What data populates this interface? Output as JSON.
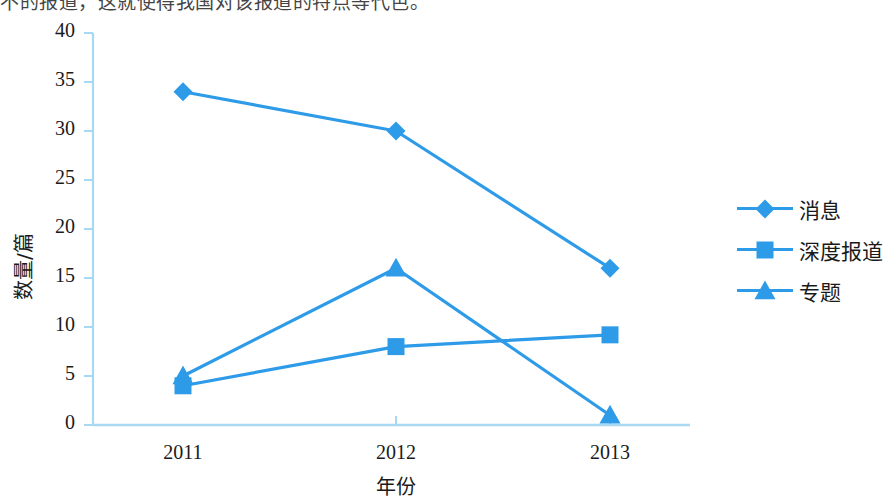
{
  "caption": "不的报道，这就使得我国对该报道的特点等代色。",
  "legend": {
    "position": "right",
    "items": [
      {
        "label": "消息",
        "marker": "diamond",
        "color": "#2E9BE8"
      },
      {
        "label": "深度报道",
        "marker": "square",
        "color": "#2E9BE8"
      },
      {
        "label": "专题",
        "marker": "triangle",
        "color": "#2E9BE8"
      }
    ]
  },
  "axes": {
    "y_title": "数量/篇",
    "x_title": "年份",
    "y_ticks": [
      "0",
      "5",
      "10",
      "15",
      "20",
      "25",
      "30",
      "35",
      "40"
    ],
    "x_ticks": [
      "2011",
      "2012",
      "2013"
    ]
  },
  "colors": {
    "series": "#2E9BE8",
    "axis": "#A9D8F2",
    "text": "#1a1a1a"
  },
  "chart_data": {
    "type": "line",
    "title": "",
    "xlabel": "年份",
    "ylabel": "数量/篇",
    "categories": [
      "2011",
      "2012",
      "2013"
    ],
    "ylim": [
      0,
      40
    ],
    "ytick_step": 5,
    "grid": false,
    "legend_position": "right",
    "series": [
      {
        "name": "消息",
        "marker": "diamond",
        "color": "#2E9BE8",
        "values": [
          34,
          30,
          16
        ]
      },
      {
        "name": "深度报道",
        "marker": "square",
        "color": "#2E9BE8",
        "values": [
          4,
          8,
          9.2
        ]
      },
      {
        "name": "专题",
        "marker": "triangle",
        "color": "#2E9BE8",
        "values": [
          5,
          16,
          1
        ]
      }
    ]
  }
}
